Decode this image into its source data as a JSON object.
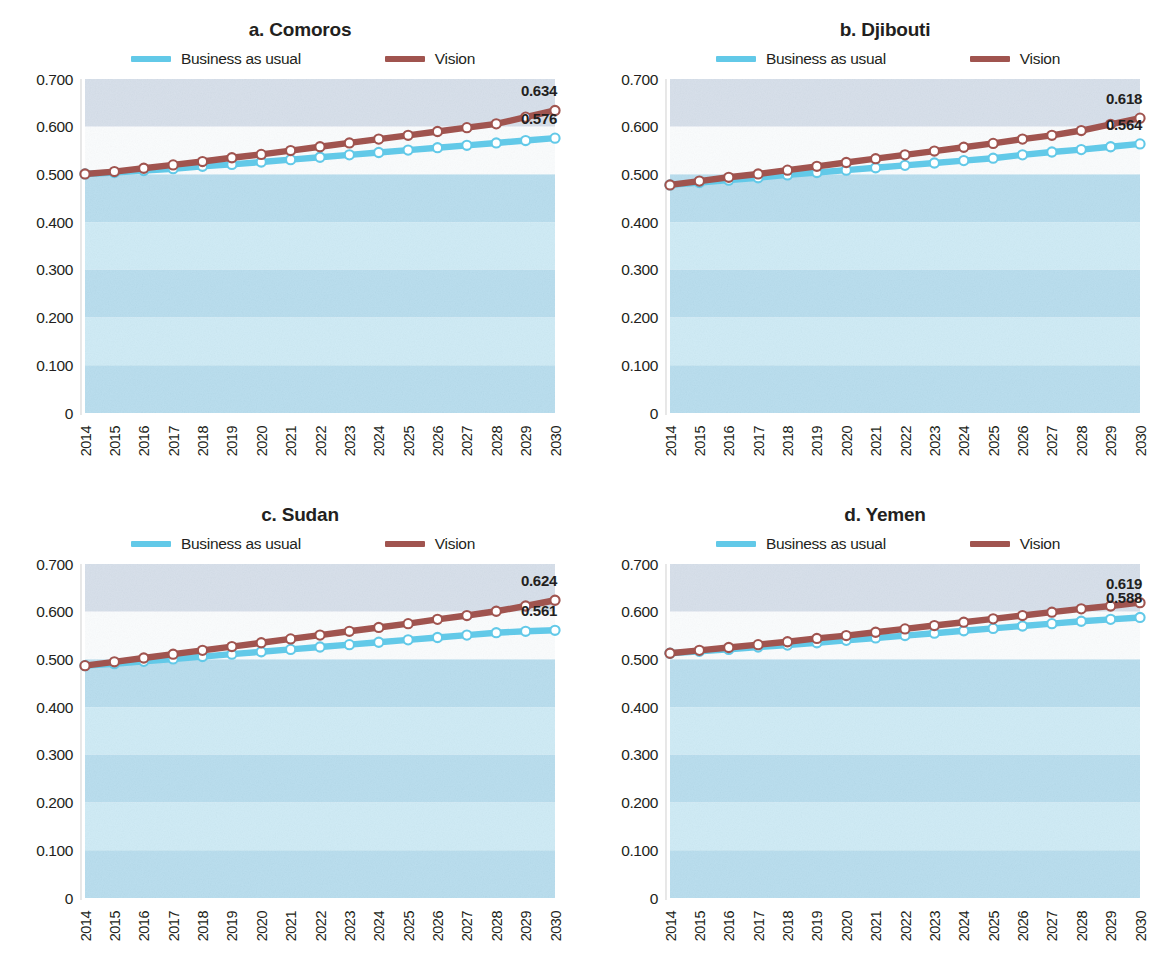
{
  "figure": {
    "legend": {
      "bau_label": "Business as usual",
      "vision_label": "Vision",
      "bau_color": "#62c9e8",
      "vision_color": "#a0544f"
    },
    "y_ticks": [
      "0.700",
      "0.600",
      "0.500",
      "0.400",
      "0.300",
      "0.200",
      "0.100",
      "0"
    ],
    "x_ticks": [
      "2014",
      "2015",
      "2016",
      "2017",
      "2018",
      "2019",
      "2020",
      "2021",
      "2022",
      "2023",
      "2024",
      "2025",
      "2026",
      "2027",
      "2028",
      "2029",
      "2030"
    ]
  },
  "panels": [
    {
      "key": "a",
      "title": "a. Comoros",
      "vision_end_label": "0.634",
      "bau_end_label": "0.576"
    },
    {
      "key": "b",
      "title": "b. Djibouti",
      "vision_end_label": "0.618",
      "bau_end_label": "0.564"
    },
    {
      "key": "c",
      "title": "c. Sudan",
      "vision_end_label": "0.624",
      "bau_end_label": "0.561"
    },
    {
      "key": "d",
      "title": "d. Yemen",
      "vision_end_label": "0.619",
      "bau_end_label": "0.588"
    }
  ],
  "chart_data": [
    {
      "type": "line",
      "title": "a. Comoros",
      "xlabel": "",
      "ylabel": "",
      "ylim": [
        0,
        0.7
      ],
      "yticks": [
        0,
        0.1,
        0.2,
        0.3,
        0.4,
        0.5,
        0.6,
        0.7
      ],
      "grid": "horizontal-bands",
      "legend_position": "top-center",
      "x": [
        2014,
        2015,
        2016,
        2017,
        2018,
        2019,
        2020,
        2021,
        2022,
        2023,
        2024,
        2025,
        2026,
        2027,
        2028,
        2029,
        2030
      ],
      "series": [
        {
          "name": "Business as usual",
          "color": "#62c9e8",
          "values": [
            0.501,
            0.504,
            0.508,
            0.512,
            0.517,
            0.521,
            0.526,
            0.531,
            0.536,
            0.541,
            0.546,
            0.551,
            0.556,
            0.561,
            0.566,
            0.571,
            0.576
          ],
          "end_label": "0.576"
        },
        {
          "name": "Vision",
          "color": "#a0544f",
          "values": [
            0.501,
            0.506,
            0.513,
            0.52,
            0.527,
            0.535,
            0.542,
            0.55,
            0.558,
            0.566,
            0.574,
            0.582,
            0.59,
            0.598,
            0.606,
            0.62,
            0.634
          ],
          "end_label": "0.634"
        }
      ]
    },
    {
      "type": "line",
      "title": "b. Djibouti",
      "xlabel": "",
      "ylabel": "",
      "ylim": [
        0,
        0.7
      ],
      "yticks": [
        0,
        0.1,
        0.2,
        0.3,
        0.4,
        0.5,
        0.6,
        0.7
      ],
      "grid": "horizontal-bands",
      "legend_position": "top-center",
      "x": [
        2014,
        2015,
        2016,
        2017,
        2018,
        2019,
        2020,
        2021,
        2022,
        2023,
        2024,
        2025,
        2026,
        2027,
        2028,
        2029,
        2030
      ],
      "series": [
        {
          "name": "Business as usual",
          "color": "#62c9e8",
          "values": [
            0.478,
            0.483,
            0.488,
            0.493,
            0.499,
            0.504,
            0.509,
            0.514,
            0.519,
            0.524,
            0.529,
            0.534,
            0.541,
            0.547,
            0.552,
            0.558,
            0.564
          ],
          "end_label": "0.564"
        },
        {
          "name": "Vision",
          "color": "#a0544f",
          "values": [
            0.478,
            0.486,
            0.494,
            0.501,
            0.509,
            0.517,
            0.525,
            0.533,
            0.541,
            0.549,
            0.557,
            0.565,
            0.574,
            0.582,
            0.592,
            0.605,
            0.618
          ],
          "end_label": "0.618"
        }
      ]
    },
    {
      "type": "line",
      "title": "c. Sudan",
      "xlabel": "",
      "ylabel": "",
      "ylim": [
        0,
        0.7
      ],
      "yticks": [
        0,
        0.1,
        0.2,
        0.3,
        0.4,
        0.5,
        0.6,
        0.7
      ],
      "grid": "horizontal-bands",
      "legend_position": "top-center",
      "x": [
        2014,
        2015,
        2016,
        2017,
        2018,
        2019,
        2020,
        2021,
        2022,
        2023,
        2024,
        2025,
        2026,
        2027,
        2028,
        2029,
        2030
      ],
      "series": [
        {
          "name": "Business as usual",
          "color": "#62c9e8",
          "values": [
            0.487,
            0.491,
            0.496,
            0.501,
            0.506,
            0.511,
            0.516,
            0.521,
            0.526,
            0.531,
            0.536,
            0.541,
            0.546,
            0.551,
            0.556,
            0.559,
            0.561
          ],
          "end_label": "0.561"
        },
        {
          "name": "Vision",
          "color": "#a0544f",
          "values": [
            0.487,
            0.495,
            0.503,
            0.511,
            0.519,
            0.527,
            0.535,
            0.543,
            0.551,
            0.559,
            0.567,
            0.575,
            0.584,
            0.592,
            0.601,
            0.612,
            0.624
          ],
          "end_label": "0.624"
        }
      ]
    },
    {
      "type": "line",
      "title": "d. Yemen",
      "xlabel": "",
      "ylabel": "",
      "ylim": [
        0,
        0.7
      ],
      "yticks": [
        0,
        0.1,
        0.2,
        0.3,
        0.4,
        0.5,
        0.6,
        0.7
      ],
      "grid": "horizontal-bands",
      "legend_position": "top-center",
      "x": [
        2014,
        2015,
        2016,
        2017,
        2018,
        2019,
        2020,
        2021,
        2022,
        2023,
        2024,
        2025,
        2026,
        2027,
        2028,
        2029,
        2030
      ],
      "series": [
        {
          "name": "Business as usual",
          "color": "#62c9e8",
          "values": [
            0.513,
            0.517,
            0.521,
            0.526,
            0.53,
            0.535,
            0.54,
            0.545,
            0.55,
            0.555,
            0.56,
            0.565,
            0.57,
            0.575,
            0.58,
            0.584,
            0.588
          ],
          "end_label": "0.588"
        },
        {
          "name": "Vision",
          "color": "#a0544f",
          "values": [
            0.513,
            0.519,
            0.525,
            0.531,
            0.537,
            0.544,
            0.55,
            0.557,
            0.564,
            0.571,
            0.578,
            0.585,
            0.592,
            0.599,
            0.606,
            0.612,
            0.619
          ],
          "end_label": "0.619"
        }
      ]
    }
  ]
}
